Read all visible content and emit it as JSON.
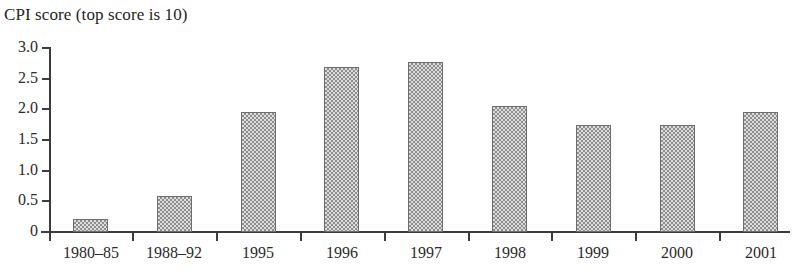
{
  "chart_data": {
    "type": "bar",
    "title": "CPI score (top score is 10)",
    "xlabel": "",
    "ylabel": "",
    "ylim": [
      0,
      3.0
    ],
    "yticks": [
      "0",
      "0.5",
      "1.0",
      "1.5",
      "2.0",
      "2.5",
      "3.0"
    ],
    "ytick_values": [
      0,
      0.5,
      1.0,
      1.5,
      2.0,
      2.5,
      3.0
    ],
    "grid": false,
    "legend": "none",
    "categories": [
      "1980–85",
      "1988–92",
      "1995",
      "1996",
      "1997",
      "1998",
      "1999",
      "2000",
      "2001"
    ],
    "values": [
      0.22,
      0.59,
      1.96,
      2.69,
      2.77,
      2.05,
      1.74,
      1.74,
      1.96
    ],
    "bar_fill": "#b9b9b9",
    "bar_pattern": "checkerboard-dither",
    "bar_border_color": "#6e6e6e",
    "axis_color": "#3b3b3b"
  }
}
